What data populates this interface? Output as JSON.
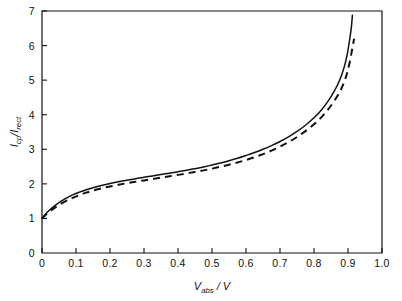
{
  "chart_data": {
    "type": "line",
    "title": "",
    "xlabel": "V_abs / V",
    "ylabel": "I_cp / I_rect",
    "xlabel_parts": {
      "main": "V",
      "sub": "abs",
      "tail": " / V"
    },
    "ylabel_parts": {
      "main1": "I",
      "sub1": "cp",
      "mid": "/",
      "main2": "I",
      "sub2": "rect"
    },
    "xlim": [
      0,
      1.0
    ],
    "ylim": [
      0,
      7
    ],
    "grid": false,
    "legend": "none",
    "xticks": [
      0,
      0.1,
      0.2,
      0.3,
      0.4,
      0.5,
      0.6,
      0.7,
      0.8,
      0.9,
      1.0
    ],
    "xticklabels": [
      "0",
      "0.1",
      "0.2",
      "0.3",
      "0.4",
      "0.5",
      "0.6",
      "0.7",
      "0.8",
      "0.9",
      "1.0"
    ],
    "yticks": [
      0,
      1,
      2,
      3,
      4,
      5,
      6,
      7
    ],
    "yticklabels": [
      "0",
      "1",
      "2",
      "3",
      "4",
      "5",
      "6",
      "7"
    ],
    "series": [
      {
        "name": "solid",
        "style": "solid",
        "color": "#111111",
        "x": [
          0.0,
          0.01,
          0.02,
          0.035,
          0.05,
          0.07,
          0.09,
          0.11,
          0.13,
          0.15,
          0.175,
          0.2,
          0.225,
          0.25,
          0.275,
          0.3,
          0.325,
          0.35,
          0.375,
          0.4,
          0.425,
          0.45,
          0.475,
          0.5,
          0.525,
          0.55,
          0.575,
          0.6,
          0.625,
          0.65,
          0.675,
          0.7,
          0.725,
          0.75,
          0.775,
          0.8,
          0.82,
          0.84,
          0.855,
          0.87,
          0.88,
          0.89,
          0.898,
          0.905,
          0.91,
          0.913
        ],
        "y": [
          1.0,
          1.12,
          1.22,
          1.35,
          1.46,
          1.58,
          1.68,
          1.76,
          1.83,
          1.89,
          1.955,
          2.01,
          2.06,
          2.105,
          2.15,
          2.19,
          2.23,
          2.27,
          2.31,
          2.35,
          2.395,
          2.44,
          2.49,
          2.545,
          2.605,
          2.67,
          2.74,
          2.82,
          2.905,
          3.0,
          3.105,
          3.225,
          3.36,
          3.515,
          3.695,
          3.91,
          4.115,
          4.37,
          4.6,
          4.88,
          5.11,
          5.42,
          5.76,
          6.18,
          6.54,
          6.88
        ]
      },
      {
        "name": "dashed",
        "style": "dashed",
        "color": "#111111",
        "x": [
          0.0,
          0.01,
          0.02,
          0.035,
          0.05,
          0.07,
          0.09,
          0.11,
          0.13,
          0.15,
          0.175,
          0.2,
          0.225,
          0.25,
          0.275,
          0.3,
          0.325,
          0.35,
          0.375,
          0.4,
          0.425,
          0.45,
          0.475,
          0.5,
          0.525,
          0.55,
          0.575,
          0.6,
          0.625,
          0.65,
          0.675,
          0.7,
          0.725,
          0.75,
          0.775,
          0.8,
          0.82,
          0.84,
          0.855,
          0.87,
          0.88,
          0.89,
          0.898,
          0.905,
          0.912,
          0.918
        ],
        "y": [
          1.0,
          1.095,
          1.18,
          1.29,
          1.39,
          1.5,
          1.595,
          1.675,
          1.745,
          1.805,
          1.87,
          1.925,
          1.975,
          2.02,
          2.06,
          2.1,
          2.14,
          2.18,
          2.22,
          2.26,
          2.3,
          2.345,
          2.39,
          2.44,
          2.495,
          2.555,
          2.62,
          2.69,
          2.77,
          2.86,
          2.96,
          3.075,
          3.205,
          3.355,
          3.525,
          3.725,
          3.91,
          4.135,
          4.33,
          4.56,
          4.745,
          4.98,
          5.23,
          5.52,
          5.88,
          6.2
        ]
      }
    ]
  }
}
